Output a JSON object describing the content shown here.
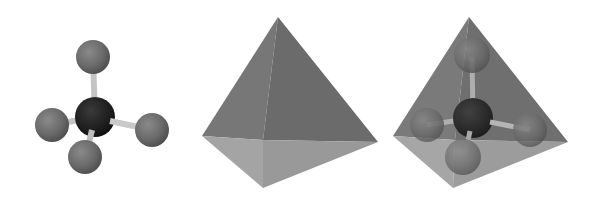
{
  "diagram": {
    "title": "",
    "panels": [
      {
        "id": "ball-and-stick",
        "description": "Tetrahedral molecule ball-and-stick model"
      },
      {
        "id": "tetrahedron",
        "description": "Solid tetrahedron"
      },
      {
        "id": "overlay",
        "description": "Molecule inside translucent tetrahedron"
      }
    ],
    "colors": {
      "background": "#ffffff",
      "outer_atom": "#6b6b6b",
      "central_atom": "#1e1e1e",
      "bond": "#cfcfcf",
      "face_left_top": "#767676",
      "face_right_top": "#6a6a6a",
      "face_left_bottom": "#a3a3a3",
      "face_right_bottom": "#999999"
    }
  }
}
